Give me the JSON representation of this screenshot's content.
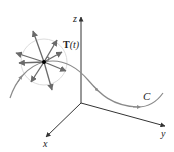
{
  "diagram": {
    "axes": {
      "z_label": "z",
      "y_label": "y",
      "x_label": "x"
    },
    "curve_label": "C",
    "vector_label_bold": "T",
    "vector_label_arg": "(t)",
    "colors": {
      "axis": "#333333",
      "curve": "#8a8a8a",
      "arrows": "#6a6a6a",
      "circle": "#dcdcdc",
      "point": "#000000"
    }
  }
}
